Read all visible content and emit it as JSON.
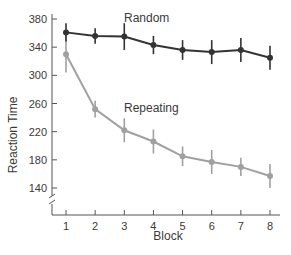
{
  "chart_data": {
    "type": "line",
    "title": "",
    "xlabel": "Block",
    "ylabel": "Reaction Time",
    "x": [
      1,
      2,
      3,
      4,
      5,
      6,
      7,
      8
    ],
    "yticks": [
      140,
      180,
      220,
      260,
      300,
      340,
      380
    ],
    "ylim": [
      110,
      390
    ],
    "axis_break": true,
    "grid": false,
    "series": [
      {
        "name": "Random",
        "color": "#333333",
        "values": [
          361,
          356,
          355,
          343,
          336,
          333,
          336,
          325
        ],
        "errors": [
          13,
          11,
          19,
          13,
          14,
          17,
          17,
          17
        ]
      },
      {
        "name": "Repeating",
        "color": "#a0a0a0",
        "values": [
          330,
          252,
          222,
          206,
          185,
          177,
          170,
          157
        ],
        "errors": [
          26,
          12,
          17,
          17,
          14,
          17,
          13,
          17
        ]
      }
    ],
    "annotations": [
      {
        "text": "Random",
        "near_series": "Random"
      },
      {
        "text": "Repeating",
        "near_series": "Repeating"
      }
    ]
  }
}
